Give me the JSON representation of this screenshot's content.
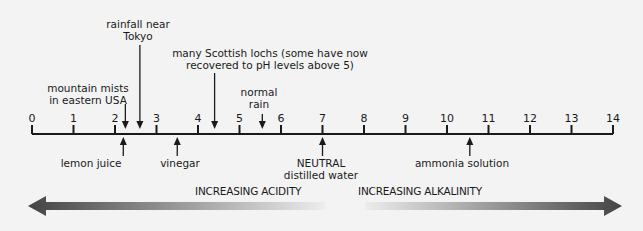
{
  "scale": {
    "min": 0,
    "max": 14,
    "ticks": [
      "0",
      "1",
      "2",
      "3",
      "4",
      "5",
      "6",
      "7",
      "8",
      "9",
      "10",
      "11",
      "12",
      "13",
      "14"
    ]
  },
  "annotations_above": [
    {
      "id": "mountain-mists",
      "lines": [
        "mountain mists",
        "in eastern USA"
      ],
      "ph": 2.25
    },
    {
      "id": "rainfall-tokyo",
      "lines": [
        "rainfall near",
        "Tokyo"
      ],
      "ph": 2.6
    },
    {
      "id": "scottish-lochs",
      "lines": [
        "many Scottish lochs (some have now",
        "recovered to pH levels above 5)"
      ],
      "ph": 4.4
    },
    {
      "id": "normal-rain",
      "lines": [
        "normal",
        "rain"
      ],
      "ph": 5.55
    }
  ],
  "annotations_below": [
    {
      "id": "lemon-juice",
      "lines": [
        "lemon juice"
      ],
      "ph": 2.2
    },
    {
      "id": "vinegar",
      "lines": [
        "vinegar"
      ],
      "ph": 3.5
    },
    {
      "id": "neutral",
      "lines": [
        "NEUTRAL",
        "distilled water"
      ],
      "ph": 7
    },
    {
      "id": "ammonia",
      "lines": [
        "ammonia solution"
      ],
      "ph": 10.55
    }
  ],
  "direction": {
    "acidity_label": "INCREASING ACIDITY",
    "alkalinity_label": "INCREASING ALKALINITY"
  },
  "colors": {
    "background": "#f3f3f3",
    "ink": "#1a1a1a",
    "arrow_dark": "#4a4a4a",
    "arrow_light": "#ededed"
  }
}
